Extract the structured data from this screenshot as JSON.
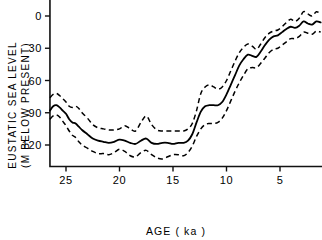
{
  "chart_data": {
    "type": "line",
    "title": "",
    "xlabel": "AGE (ka)",
    "ylabel_line1": "EUSTATIC SEA LEVEL",
    "ylabel_line2": "(M BELOW PRESENT)",
    "xlabel_full": "AGE ( ka )",
    "ylabel_full": "EUSTATIC SEA LEVEL (M BELOW PRESENT)",
    "x_ticks": [
      25,
      20,
      15,
      10,
      5
    ],
    "x_tick_labels": [
      "25",
      "20",
      "15",
      "10",
      "5"
    ],
    "y_ticks": [
      0,
      30,
      60,
      90,
      120
    ],
    "y_tick_labels": [
      "0",
      "30",
      "60",
      "90",
      "120"
    ],
    "xlim": [
      26.5,
      1.1
    ],
    "ylim": [
      140,
      -6
    ],
    "y_axis_inverted": true,
    "x_axis_inverted": true,
    "grid": false,
    "legend": false,
    "legend_position": "none",
    "line_color": "#000000",
    "band_color": "#000000",
    "background_color": "#ffffff",
    "x": [
      26.5,
      26.2,
      25.9,
      25.6,
      25.3,
      25.0,
      24.7,
      24.4,
      24.1,
      23.8,
      23.5,
      23.0,
      22.5,
      22.0,
      21.5,
      21.0,
      20.5,
      20.0,
      19.5,
      19.0,
      18.5,
      18.0,
      17.5,
      17.0,
      16.5,
      16.0,
      15.5,
      15.0,
      14.5,
      14.0,
      13.6,
      13.2,
      12.8,
      12.4,
      12.0,
      11.6,
      11.2,
      10.8,
      10.4,
      10.0,
      9.6,
      9.2,
      8.8,
      8.4,
      8.0,
      7.6,
      7.2,
      6.8,
      6.4,
      6.0,
      5.6,
      5.2,
      4.8,
      4.4,
      4.0,
      3.6,
      3.2,
      2.8,
      2.4,
      2.0,
      1.6,
      1.2
    ],
    "series": [
      {
        "name": "upper confidence bound",
        "style": "dashed",
        "values": [
          76,
          73,
          72,
          74,
          77,
          80,
          84,
          85,
          84,
          86,
          90,
          95,
          101,
          104,
          105,
          106,
          106,
          105,
          102,
          105,
          107,
          99,
          93,
          101,
          106,
          107,
          107,
          107,
          107,
          107,
          105,
          100,
          88,
          72,
          66,
          64,
          66,
          68,
          66,
          60,
          51,
          42,
          34,
          29,
          26,
          28,
          31,
          26,
          20,
          16,
          14,
          13,
          10,
          6,
          3,
          5,
          2,
          -4,
          -2,
          0,
          -4,
          -2
        ]
      },
      {
        "name": "mean sea level curve",
        "style": "solid",
        "values": [
          88,
          84,
          83,
          85,
          88,
          91,
          96,
          99,
          100,
          103,
          106,
          110,
          114,
          116,
          117,
          118,
          117,
          115,
          116,
          118,
          119,
          116,
          114,
          118,
          119,
          118,
          118,
          119,
          118,
          118,
          116,
          110,
          99,
          89,
          84,
          83,
          83,
          83,
          80,
          73,
          64,
          55,
          46,
          40,
          36,
          37,
          38,
          33,
          27,
          22,
          19,
          18,
          15,
          12,
          10,
          11,
          9,
          5,
          7,
          8,
          5,
          6
        ]
      },
      {
        "name": "lower confidence bound",
        "style": "dashed",
        "values": [
          96,
          93,
          92,
          94,
          98,
          102,
          107,
          111,
          113,
          117,
          120,
          123,
          126,
          128,
          128,
          129,
          127,
          124,
          126,
          130,
          131,
          127,
          125,
          129,
          132,
          133,
          131,
          129,
          129,
          130,
          127,
          121,
          112,
          105,
          101,
          100,
          100,
          99,
          95,
          88,
          79,
          70,
          62,
          55,
          49,
          48,
          48,
          44,
          39,
          34,
          31,
          30,
          27,
          24,
          21,
          21,
          19,
          15,
          16,
          17,
          14,
          15
        ]
      }
    ]
  }
}
